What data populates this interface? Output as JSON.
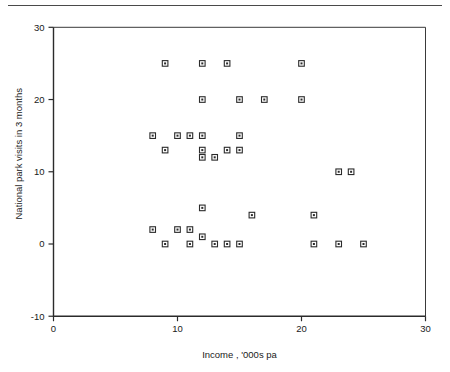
{
  "page": {
    "has_top_rule": true,
    "background_color": "#ffffff",
    "ink_color": "#2b2b2b"
  },
  "chart_data": {
    "type": "scatter",
    "title": "",
    "xlabel": "Income , '000s pa",
    "ylabel": "National park visits in 3 months",
    "xlim": [
      0,
      30
    ],
    "ylim": [
      -10,
      30
    ],
    "xticks": [
      0,
      10,
      20,
      30
    ],
    "xtick_labels": [
      "0",
      "10",
      "20",
      "30"
    ],
    "yticks": [
      -10,
      0,
      10,
      20,
      30
    ],
    "ytick_labels": [
      "-10",
      "0",
      "10",
      "20",
      "30"
    ],
    "grid": false,
    "legend": false,
    "marker_style": "open-square",
    "points": [
      {
        "x": 9,
        "y": 25
      },
      {
        "x": 12,
        "y": 25
      },
      {
        "x": 14,
        "y": 25
      },
      {
        "x": 20,
        "y": 25
      },
      {
        "x": 12,
        "y": 20
      },
      {
        "x": 15,
        "y": 20
      },
      {
        "x": 17,
        "y": 20
      },
      {
        "x": 20,
        "y": 20
      },
      {
        "x": 8,
        "y": 15
      },
      {
        "x": 10,
        "y": 15
      },
      {
        "x": 11,
        "y": 15
      },
      {
        "x": 12,
        "y": 15
      },
      {
        "x": 15,
        "y": 15
      },
      {
        "x": 9,
        "y": 13
      },
      {
        "x": 12,
        "y": 13
      },
      {
        "x": 14,
        "y": 13
      },
      {
        "x": 15,
        "y": 13
      },
      {
        "x": 12,
        "y": 12
      },
      {
        "x": 13,
        "y": 12
      },
      {
        "x": 23,
        "y": 10
      },
      {
        "x": 24,
        "y": 10
      },
      {
        "x": 12,
        "y": 5
      },
      {
        "x": 16,
        "y": 4
      },
      {
        "x": 21,
        "y": 4
      },
      {
        "x": 8,
        "y": 2
      },
      {
        "x": 10,
        "y": 2
      },
      {
        "x": 11,
        "y": 2
      },
      {
        "x": 12,
        "y": 1
      },
      {
        "x": 9,
        "y": 0
      },
      {
        "x": 11,
        "y": 0
      },
      {
        "x": 13,
        "y": 0
      },
      {
        "x": 14,
        "y": 0
      },
      {
        "x": 15,
        "y": 0
      },
      {
        "x": 21,
        "y": 0
      },
      {
        "x": 23,
        "y": 0
      },
      {
        "x": 25,
        "y": 0
      }
    ]
  }
}
